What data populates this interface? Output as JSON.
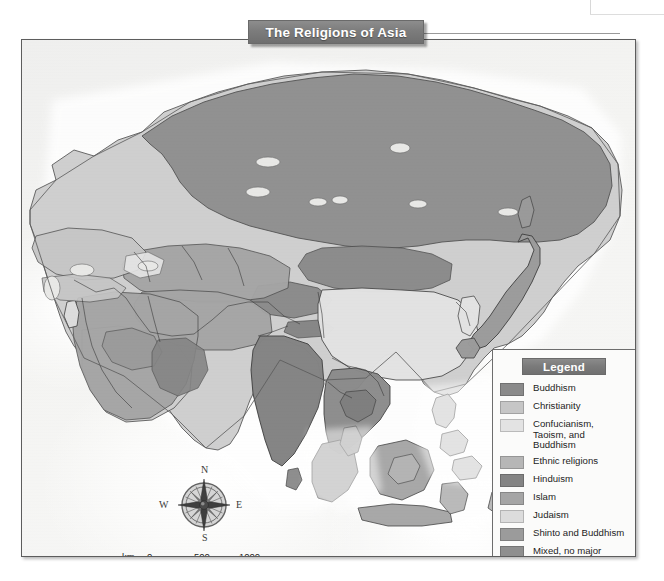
{
  "title": {
    "text": "The Religions of Asia"
  },
  "legend": {
    "heading": "Legend",
    "items": [
      {
        "label": "Buddhism",
        "color": "#8a8a8a"
      },
      {
        "label": "Christianity",
        "color": "#c6c6c6"
      },
      {
        "label": "Confucianism, Taoism, and Buddhism",
        "color": "#e3e3e3"
      },
      {
        "label": "Ethnic religions",
        "color": "#b6b6b6"
      },
      {
        "label": "Hinduism",
        "color": "#848484"
      },
      {
        "label": "Islam",
        "color": "#a5a5a5"
      },
      {
        "label": "Judaism",
        "color": "#dcdcdc"
      },
      {
        "label": "Shinto and Buddhism",
        "color": "#9b9b9b"
      },
      {
        "label": "Mixed, no major religion",
        "color": "#8f8f8f"
      }
    ]
  },
  "compass": {
    "north": "N",
    "south": "S",
    "west": "W",
    "east": "E"
  },
  "scale": {
    "km_unit": "km",
    "mi_unit": "mi",
    "km_ticks": [
      "0",
      "500",
      "1000"
    ],
    "mi_ticks": [
      "0",
      "500",
      "1000"
    ]
  },
  "map_regions": [
    {
      "name": "Siberia / Russia",
      "religion": "Mixed, no major religion"
    },
    {
      "name": "Central Asia",
      "religion": "Islam"
    },
    {
      "name": "Middle East / Arabia",
      "religion": "Islam"
    },
    {
      "name": "India",
      "religion": "Hinduism"
    },
    {
      "name": "China",
      "religion": "Confucianism, Taoism, and Buddhism"
    },
    {
      "name": "Japan",
      "religion": "Shinto and Buddhism"
    },
    {
      "name": "Mainland Southeast Asia",
      "religion": "Buddhism"
    },
    {
      "name": "Indonesia / Malaysia",
      "religion": "Islam"
    },
    {
      "name": "Philippines",
      "religion": "Christianity"
    },
    {
      "name": "Israel",
      "religion": "Judaism"
    },
    {
      "name": "Mongolia / Tibet",
      "religion": "Buddhism"
    },
    {
      "name": "Eastern Europe",
      "religion": "Christianity"
    }
  ],
  "colors": {
    "frame_border": "#5d5d5d",
    "banner_fill": "#7c7c7c",
    "banner_text": "#ffffff",
    "ocean": "#f4f4f2",
    "coastline": "#5a5a5a",
    "border_line": "#3a3a3a"
  }
}
